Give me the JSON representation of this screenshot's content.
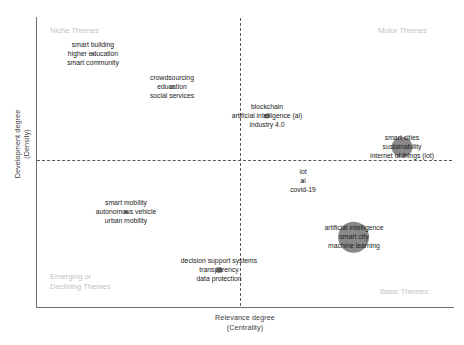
{
  "figure": {
    "type": "strategic-thematic-map",
    "background": "#ffffff",
    "bubble_color": "#7f7f7f",
    "quadrant_label_color": "#c3c3c3",
    "axis_color": "#6d6d6d"
  },
  "axes": {
    "x": {
      "title": "Relevance degree",
      "subtitle": "(Centrality)"
    },
    "y": {
      "title": "Development degree",
      "subtitle": "(Density)"
    }
  },
  "quadrants": {
    "top_left": "Niche Themes",
    "top_right": "Motor Themes",
    "bottom_left": "Emerging or\nDeclining Themes",
    "bottom_right": "Basic Themes"
  },
  "chart_data": {
    "type": "scatter",
    "title": "",
    "xlabel": "Relevance degree (Centrality)",
    "ylabel": "Development degree (Density)",
    "grid": false,
    "legend": false,
    "quadrant_divider_x": 0.5,
    "quadrant_divider_y": 0.5,
    "points": [
      {
        "id": "smart-building",
        "quadrant": "Niche Themes",
        "x": 0.152,
        "y": 0.905,
        "size": 3,
        "terms": [
          "smart building",
          "higher education",
          "smart community"
        ]
      },
      {
        "id": "crowdsourcing",
        "quadrant": "Niche Themes",
        "x": 0.393,
        "y": 0.79,
        "size": 4,
        "terms": [
          "crowdsourcing",
          "education",
          "social services"
        ]
      },
      {
        "id": "blockchain",
        "quadrant": "Motor Themes",
        "x": 0.62,
        "y": 0.69,
        "size": 5,
        "terms": [
          "blockchain",
          "artificial intelligence (ai)",
          "industry 4.0"
        ]
      },
      {
        "id": "smart-cities",
        "quadrant": "Motor Themes",
        "x": 0.858,
        "y": 0.58,
        "size": 20,
        "terms": [
          "smart cities",
          "sustainability",
          "internet of things (iot)"
        ]
      },
      {
        "id": "iot",
        "quadrant": "Basic Themes",
        "x": 0.645,
        "y": 0.43,
        "size": 2,
        "terms": [
          "iot",
          "ai",
          "covid-19"
        ]
      },
      {
        "id": "smart-mobility",
        "quadrant": "Emerging or Declining Themes",
        "x": 0.237,
        "y": 0.335,
        "size": 4,
        "terms": [
          "smart mobility",
          "autonomous vehicle",
          "urban mobility"
        ]
      },
      {
        "id": "artificial-intelligence",
        "quadrant": "Basic Themes",
        "x": 0.765,
        "y": 0.245,
        "size": 30,
        "terms": [
          "artificial intelligence",
          "smart city",
          "machine learning"
        ]
      },
      {
        "id": "decision-support-systems",
        "quadrant": "Emerging or Declining Themes",
        "x": 0.448,
        "y": 0.135,
        "size": 6,
        "terms": [
          "decision support systems",
          "transparency",
          "data protection"
        ]
      }
    ]
  },
  "layout": {
    "clusters": [
      {
        "id": "smart-building",
        "cx": 93,
        "cy": 54,
        "r": 1.7
      },
      {
        "id": "crowdsourcing",
        "cx": 172,
        "cy": 87,
        "r": 2.2
      },
      {
        "id": "blockchain",
        "cx": 267,
        "cy": 116,
        "r": 2.8
      },
      {
        "id": "smart-cities",
        "cx": 402,
        "cy": 147,
        "r": 10.5
      },
      {
        "id": "iot",
        "cx": 303,
        "cy": 181,
        "r": 1.0
      },
      {
        "id": "smart-mobility",
        "cx": 126,
        "cy": 212,
        "r": 2.2
      },
      {
        "id": "artificial-intelligence",
        "cx": 354,
        "cy": 237,
        "r": 15.5
      },
      {
        "id": "decision-support-systems",
        "cx": 219,
        "cy": 270,
        "r": 3.2
      }
    ]
  }
}
